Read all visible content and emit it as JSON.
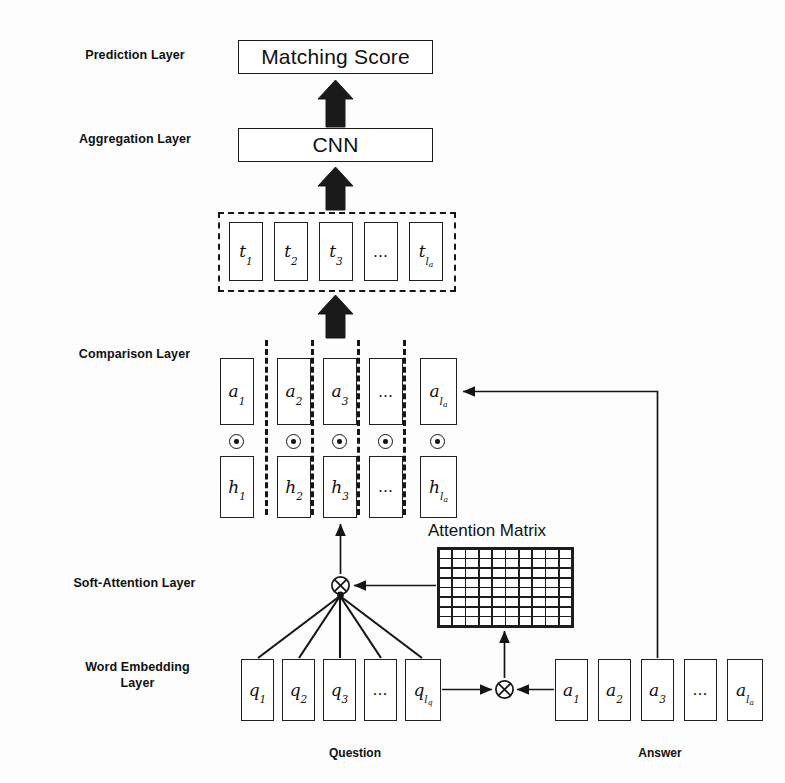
{
  "figure": {
    "ink_color": "#111111",
    "background": "#fdfdfd"
  },
  "layer_labels": [
    {
      "id": "prediction",
      "text": "Prediction Layer"
    },
    {
      "id": "aggregation",
      "text": "Aggregation Layer"
    },
    {
      "id": "comparison",
      "text": "Comparison Layer"
    },
    {
      "id": "soft_attention",
      "text": "Soft-Attention Layer"
    },
    {
      "id": "word_embedding",
      "text": "Word Embedding\nLayer"
    }
  ],
  "prediction": {
    "box_label": "Matching Score"
  },
  "aggregation": {
    "box_label": "CNN"
  },
  "representation": {
    "cells": [
      "t₁",
      "t₂",
      "t₃",
      "…",
      "t_{l_a}"
    ],
    "cell_parts": [
      {
        "base": "t",
        "sub": "1"
      },
      {
        "base": "t",
        "sub": "2"
      },
      {
        "base": "t",
        "sub": "3"
      },
      {
        "base": "…",
        "sub": ""
      },
      {
        "base": "t",
        "sub": "l",
        "subsub": "a"
      }
    ]
  },
  "comparison": {
    "top_row": [
      {
        "base": "a",
        "sub": "1"
      },
      {
        "base": "a",
        "sub": "2"
      },
      {
        "base": "a",
        "sub": "3"
      },
      {
        "base": "…",
        "sub": ""
      },
      {
        "base": "a",
        "sub": "l",
        "subsub": "a"
      }
    ],
    "bottom_row": [
      {
        "base": "h",
        "sub": "1"
      },
      {
        "base": "h",
        "sub": "2"
      },
      {
        "base": "h",
        "sub": "3"
      },
      {
        "base": "…",
        "sub": ""
      },
      {
        "base": "h",
        "sub": "l",
        "subsub": "a"
      }
    ],
    "operator": "elementwise-product",
    "operator_glyph": "⊙",
    "operator_count": 5
  },
  "attention": {
    "matrix_title": "Attention Matrix",
    "matrix_columns": 10,
    "matrix_rows": 8,
    "operator_glyph": "⊗",
    "operator_name": "outer-product"
  },
  "embedding": {
    "question_cells": [
      {
        "base": "q",
        "sub": "1"
      },
      {
        "base": "q",
        "sub": "2"
      },
      {
        "base": "q",
        "sub": "3"
      },
      {
        "base": "…",
        "sub": ""
      },
      {
        "base": "q",
        "sub": "l",
        "subsub": "q"
      }
    ],
    "answer_cells": [
      {
        "base": "a",
        "sub": "1"
      },
      {
        "base": "a",
        "sub": "2"
      },
      {
        "base": "a",
        "sub": "3"
      },
      {
        "base": "…",
        "sub": ""
      },
      {
        "base": "a",
        "sub": "l",
        "subsub": "a"
      }
    ],
    "operator_glyph": "⊗",
    "question_label": "Question",
    "answer_label": "Answer"
  }
}
